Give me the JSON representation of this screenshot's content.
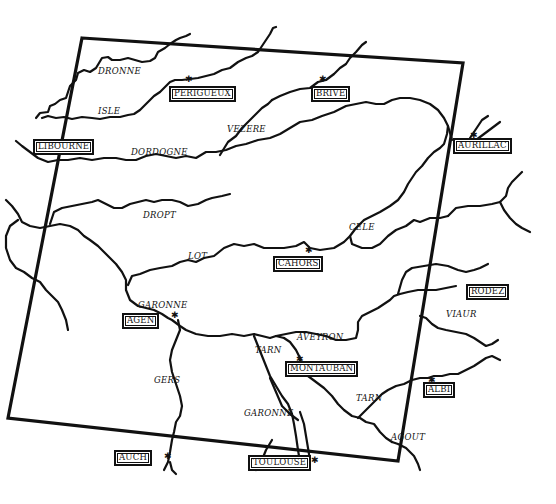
{
  "map": {
    "style": {
      "ink": "#111111",
      "paper": "#ffffff"
    },
    "cities": [
      {
        "id": "perigueux",
        "label": "PERIGUEUX",
        "x": 169,
        "y": 86
      },
      {
        "id": "brive",
        "label": "BRIVE",
        "x": 311,
        "y": 86
      },
      {
        "id": "libourne",
        "label": "LIBOURNE",
        "x": 33,
        "y": 139
      },
      {
        "id": "aurillac",
        "label": "AURILLAC",
        "x": 453,
        "y": 138
      },
      {
        "id": "cahors",
        "label": "CAHORS",
        "x": 273,
        "y": 256
      },
      {
        "id": "rodez",
        "label": "RODEZ",
        "x": 466,
        "y": 284
      },
      {
        "id": "agen",
        "label": "AGEN",
        "x": 122,
        "y": 313
      },
      {
        "id": "montauban",
        "label": "MONTAUBAN",
        "x": 285,
        "y": 361
      },
      {
        "id": "albi",
        "label": "ALBI",
        "x": 423,
        "y": 382
      },
      {
        "id": "auch",
        "label": "AUCH",
        "x": 114,
        "y": 450
      },
      {
        "id": "toulouse",
        "label": "TOULOUSE",
        "x": 248,
        "y": 455
      }
    ],
    "rivers": [
      {
        "id": "dronne",
        "label": "DRONNE",
        "x": 98,
        "y": 67
      },
      {
        "id": "isle",
        "label": "ISLE",
        "x": 98,
        "y": 107
      },
      {
        "id": "dordogne",
        "label": "DORDOGNE",
        "x": 131,
        "y": 148
      },
      {
        "id": "vezere",
        "label": "VEZERE",
        "x": 227,
        "y": 125
      },
      {
        "id": "dropt",
        "label": "DROPT",
        "x": 143,
        "y": 211
      },
      {
        "id": "lot",
        "label": "LOT",
        "x": 188,
        "y": 252
      },
      {
        "id": "cele",
        "label": "CELE",
        "x": 349,
        "y": 223
      },
      {
        "id": "garonne-north",
        "label": "GARONNE",
        "x": 138,
        "y": 301
      },
      {
        "id": "aveyron",
        "label": "AVEYRON",
        "x": 297,
        "y": 333
      },
      {
        "id": "viaur",
        "label": "VIAUR",
        "x": 446,
        "y": 310
      },
      {
        "id": "tarn-north",
        "label": "TARN",
        "x": 255,
        "y": 346
      },
      {
        "id": "gers",
        "label": "GERS",
        "x": 154,
        "y": 376
      },
      {
        "id": "garonne-south",
        "label": "GARONNE",
        "x": 244,
        "y": 409
      },
      {
        "id": "tarn-south",
        "label": "TARN",
        "x": 356,
        "y": 394
      },
      {
        "id": "agout",
        "label": "AGOUT",
        "x": 391,
        "y": 433
      }
    ],
    "frame": {
      "corners": [
        [
          82,
          38
        ],
        [
          463,
          63
        ],
        [
          398,
          461
        ],
        [
          8,
          418
        ]
      ]
    }
  }
}
